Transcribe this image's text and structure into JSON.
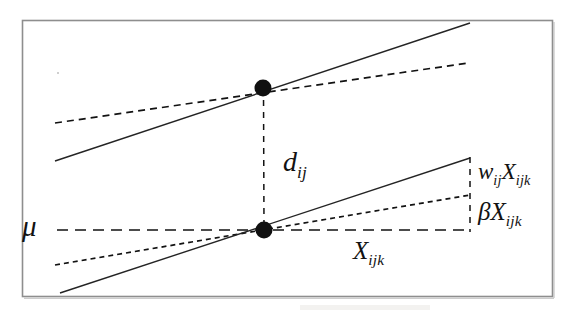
{
  "figure": {
    "kind": "statistical-regression-diagram",
    "background_color": "#ffffff",
    "ink_color": "#121212",
    "frame_color": "#8e8e8e",
    "frame": {
      "x": 22,
      "y": 20,
      "width": 531,
      "height": 277
    },
    "labels": [
      {
        "name": "mu",
        "base": "μ",
        "sub": "",
        "x": 22,
        "y": 212,
        "font_size": 29,
        "meaning": "intercept level mu"
      },
      {
        "name": "d-ij",
        "base": "d",
        "sub": "ij",
        "x": 283,
        "y": 148,
        "font_size": 28,
        "meaning": "vertical distance d subscript ij between the two anchor points"
      },
      {
        "name": "w-ij-x-ijk",
        "base": "w",
        "sub": "ij",
        "base2": "X",
        "sub2": "ijk",
        "x": 478,
        "y": 160,
        "font_size": 23,
        "meaning": "random slope effect w subscript ij times X subscript ijk"
      },
      {
        "name": "beta-x-ijk",
        "base": "β",
        "sub": "",
        "base2": "X",
        "sub2": "ijk",
        "x": 478,
        "y": 199,
        "font_size": 25,
        "meaning": "fixed slope effect beta times X subscript ijk"
      },
      {
        "name": "x-ijk",
        "base": "X",
        "sub": "ijk",
        "x": 353,
        "y": 238,
        "font_size": 25,
        "meaning": "predictor value X subscript ijk, horizontal span"
      }
    ],
    "points": [
      {
        "name": "upper-anchor-point",
        "x": 263,
        "y": 88,
        "radius": 8.5,
        "fill": "#101010"
      },
      {
        "name": "lower-anchor-point",
        "x": 264,
        "y": 230,
        "radius": 8.5,
        "fill": "#101010"
      }
    ],
    "lines": [
      {
        "name": "upper-solid-line",
        "style": "solid",
        "x1": 55,
        "y1": 161,
        "x2": 470,
        "y2": 23,
        "stroke_width": 1.4,
        "meaning": "steeper subject-specific regression line through the upper anchor point"
      },
      {
        "name": "upper-dashed-line",
        "style": "dashed",
        "x1": 55,
        "y1": 123,
        "x2": 468,
        "y2": 63,
        "stroke_width": 1.6,
        "meaning": "shallower population regression line through the upper anchor point"
      },
      {
        "name": "lower-solid-line",
        "style": "solid",
        "x1": 60,
        "y1": 293,
        "x2": 470,
        "y2": 158,
        "stroke_width": 1.4,
        "meaning": "steeper subject-specific regression line through the lower anchor point"
      },
      {
        "name": "lower-dotted-line",
        "style": "dotted",
        "x1": 55,
        "y1": 265,
        "x2": 470,
        "y2": 195,
        "stroke_width": 1.6,
        "meaning": "shallower fixed-effect regression line through the lower anchor point"
      },
      {
        "name": "mu-horizontal-dashed-line",
        "style": "dashed",
        "x1": 57,
        "y1": 230,
        "x2": 470,
        "y2": 230,
        "stroke_width": 1.4,
        "meaning": "horizontal baseline at level mu, also the X_ijk span"
      },
      {
        "name": "d-ij-vertical-dashed-connector",
        "style": "dashed",
        "x1": 263,
        "y1": 88,
        "x2": 264,
        "y2": 230,
        "stroke_width": 1.4,
        "meaning": "vertical dashed segment marking d_ij between the two anchor points"
      },
      {
        "name": "right-vertical-dashed-bracket",
        "style": "dashed",
        "x1": 470,
        "y1": 157,
        "x2": 470,
        "y2": 232,
        "stroke_width": 1.4,
        "meaning": "vertical bracket at the right edge delimiting the w_ij X_ijk and beta X_ijk effects"
      }
    ]
  }
}
